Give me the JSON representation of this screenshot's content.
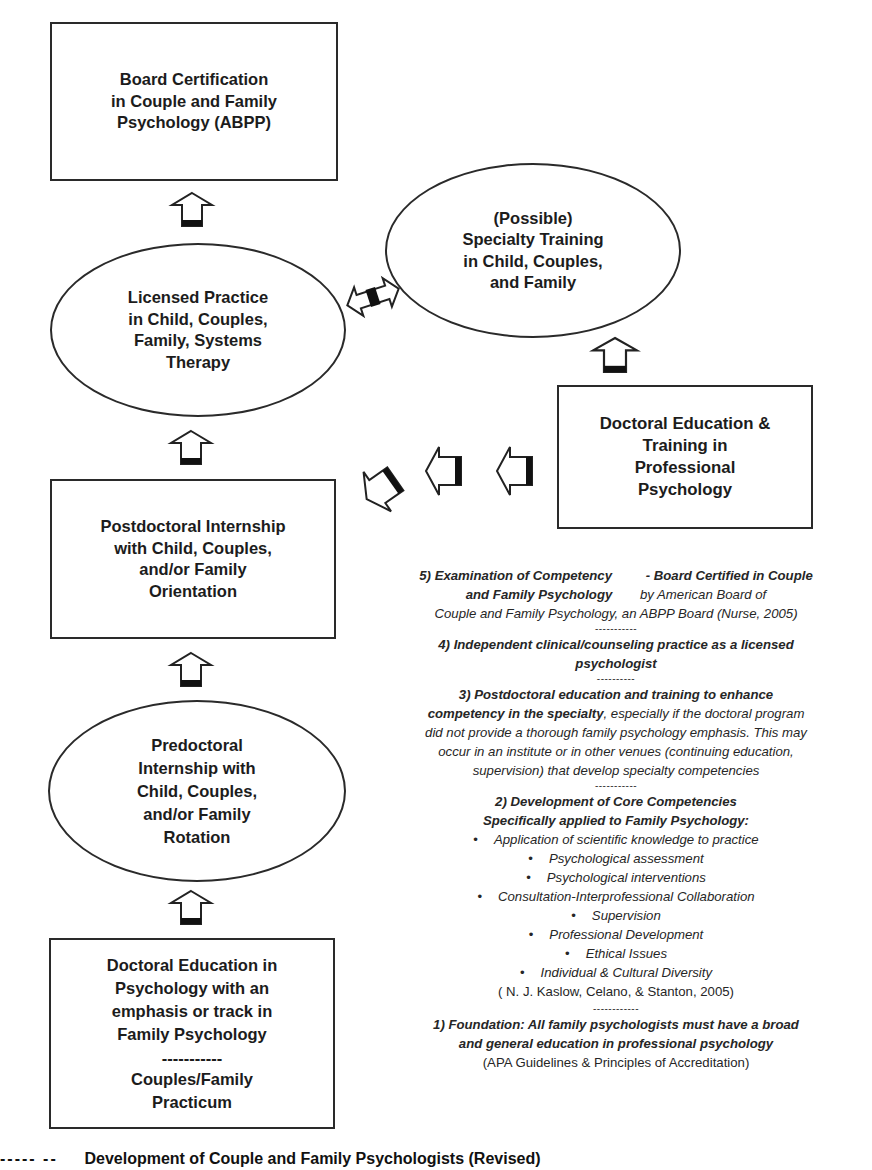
{
  "nodes": {
    "board_certification": {
      "label": "Board Certification\nin Couple and Family\nPsychology (ABPP)",
      "shape": "rectangle"
    },
    "licensed_practice": {
      "label": "Licensed Practice\nin Child, Couples,\nFamily, Systems\nTherapy",
      "shape": "ellipse"
    },
    "specialty_training": {
      "label": "(Possible)\nSpecialty Training\nin Child, Couples,\nand Family",
      "shape": "ellipse"
    },
    "doctoral_training_professional": {
      "label": "Doctoral Education &\nTraining in\nProfessional\nPsychology",
      "shape": "rectangle"
    },
    "postdoctoral_internship": {
      "label": "Postdoctoral Internship\nwith Child, Couples,\nand/or Family\nOrientation",
      "shape": "rectangle"
    },
    "predoctoral_internship": {
      "label": "Predoctoral\nInternship with\nChild, Couples,\nand/or Family\nRotation",
      "shape": "ellipse"
    },
    "doctoral_education_family": {
      "label": "Doctoral Education in\nPsychology with an\nemphasis or track in\nFamily Psychology",
      "separator": "-----------",
      "sublabel": "Couples/Family\nPracticum",
      "shape": "rectangle"
    }
  },
  "arrows": [
    {
      "from": "licensed_practice",
      "to": "board_certification",
      "direction": "up"
    },
    {
      "from": "licensed_practice",
      "to": "specialty_training",
      "direction": "bidirectional"
    },
    {
      "from": "doctoral_training_professional",
      "to": "specialty_training",
      "direction": "up"
    },
    {
      "from": "postdoctoral_internship",
      "to": "licensed_practice",
      "direction": "up"
    },
    {
      "from": "doctoral_training_professional",
      "to": "postdoctoral_internship",
      "direction": "left"
    },
    {
      "from": "predoctoral_internship",
      "to": "postdoctoral_internship",
      "direction": "up"
    },
    {
      "from": "doctoral_education_family",
      "to": "predoctoral_internship",
      "direction": "up"
    }
  ],
  "notes": {
    "step5": {
      "title_a": "5)  Examination of Competency",
      "title_b": " - Board Certified in Couple",
      "title_c": "and Family Psychology",
      "text_a": " by American Board of",
      "text_b": "Couple and Family Psychology, an ABPP Board (Nurse, 2005)"
    },
    "sep1": "-----------",
    "step4": {
      "title": "4)  Independent clinical/counseling practice as a licensed",
      "title_b": "psychologist"
    },
    "sep2": "----------",
    "step3": {
      "title_a": "3)  Postdoctoral education and training to enhance",
      "title_b": "competency in the specialty",
      "text_a": ", especially if the doctoral program",
      "text_b": "did not provide a thorough family psychology emphasis. This may",
      "text_c": "occur in an institute or in other venues (continuing education,",
      "text_d": "supervision) that develop specialty competencies"
    },
    "sep3": "-----------",
    "step2": {
      "title_a": "2)  Development of Core Competencies",
      "title_b": "Specifically applied to Family Psychology:",
      "bullets": [
        "Application of scientific knowledge to practice",
        "Psychological assessment",
        "Psychological interventions",
        "Consultation-Interprofessional Collaboration",
        "Supervision",
        "Professional Development",
        "Ethical Issues",
        "Individual & Cultural Diversity"
      ],
      "citation": "( N. J. Kaslow, Celano, & Stanton, 2005)"
    },
    "sep4": "------------",
    "step1": {
      "title_a": "1) Foundation: All family psychologists must have a broad",
      "title_b": "and general education in professional psychology",
      "citation": "(APA Guidelines & Principles of Accreditation)"
    }
  },
  "caption": {
    "prefix": "----- --",
    "text": "Development of Couple and Family Psychologists (Revised)"
  },
  "colors": {
    "line": "#2a2a2a",
    "text": "#1c1c1c",
    "background": "#ffffff"
  }
}
